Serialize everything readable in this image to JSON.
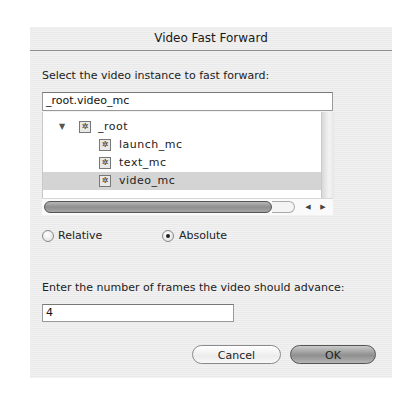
{
  "dialog": {
    "title": "Video Fast Forward",
    "instance_label": "Select the video instance to fast forward:",
    "instance_path": "_root.video_mc",
    "tree": {
      "root": {
        "label": "_root",
        "expanded": true,
        "icon": "movieclip-icon"
      },
      "children": [
        {
          "label": "launch_mc",
          "icon": "movieclip-icon",
          "selected": false
        },
        {
          "label": "text_mc",
          "icon": "movieclip-icon",
          "selected": false
        },
        {
          "label": "video_mc",
          "icon": "movieclip-icon",
          "selected": true
        }
      ]
    },
    "scroll_left_arrow": "◀",
    "scroll_right_arrow": "▶",
    "mode": {
      "options": [
        {
          "label": "Relative",
          "selected": false
        },
        {
          "label": "Absolute",
          "selected": true
        }
      ]
    },
    "frames_label": "Enter the number of frames the video should advance:",
    "frames_value": "4",
    "buttons": {
      "cancel": "Cancel",
      "ok": "OK"
    },
    "tree_expand_glyph": "▼",
    "mc_glyph": "✲"
  }
}
